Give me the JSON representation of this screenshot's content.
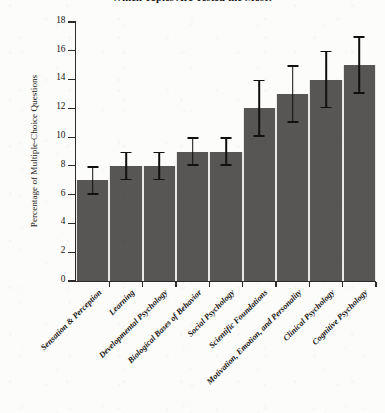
{
  "chart_data": {
    "type": "bar",
    "title": "Which Topics Are Tested the Most?",
    "xlabel": "",
    "ylabel": "Percentage of Multiple-Choice Questions",
    "ylim": [
      0,
      18
    ],
    "yticks": [
      0,
      2,
      4,
      6,
      8,
      10,
      12,
      14,
      16,
      18
    ],
    "ytick_labels": [
      "0",
      "2",
      "4",
      "6",
      "8",
      "10",
      "12",
      "14",
      "16",
      "18"
    ],
    "grid": false,
    "legend": null,
    "bar_color": "#585654",
    "error_bar_color": "#111010",
    "categories": [
      "Sensation & Perception",
      "Learning",
      "Developmental Psychology",
      "Biological Bases of Behavior",
      "Social Psychology",
      "Scientific Foundations",
      "Motivation, Emotion, and Personality",
      "Clinical Psychology",
      "Cognitive Psychology"
    ],
    "values": [
      7,
      8,
      8,
      9,
      9,
      12,
      13,
      14,
      15
    ],
    "error_low": [
      6,
      7,
      7,
      8,
      8,
      10,
      11,
      12,
      13
    ],
    "error_high": [
      8,
      9,
      9,
      10,
      10,
      14,
      15,
      16,
      17
    ]
  }
}
